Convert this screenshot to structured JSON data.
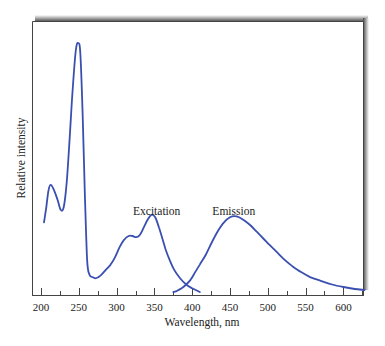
{
  "chart_data": {
    "type": "line",
    "title": "",
    "xlabel": "Wavelength, nm",
    "ylabel": "Relative intensity",
    "xlim": [
      190,
      630
    ],
    "ylim": [
      0,
      1
    ],
    "x_ticks": [
      200,
      250,
      300,
      350,
      400,
      450,
      500,
      550,
      600
    ],
    "x_tick_labels": [
      "200",
      "250",
      "300",
      "350",
      "400",
      "450",
      "500",
      "550",
      "600"
    ],
    "minor_ticks_every": 25,
    "y_ticks": [],
    "grid": false,
    "legend": null,
    "line_color": "#3a4fb0",
    "annotations": [
      {
        "text": "Excitation",
        "x": 353,
        "y": 0.3
      },
      {
        "text": "Emission",
        "x": 455,
        "y": 0.3
      }
    ],
    "series": [
      {
        "name": "Excitation",
        "x": [
          204,
          207,
          210,
          213,
          217,
          222,
          226,
          230,
          234,
          238,
          242,
          246,
          249,
          252,
          255,
          258,
          261,
          264,
          268,
          272,
          276,
          280,
          286,
          292,
          298,
          304,
          310,
          316,
          321,
          326,
          331,
          336,
          341,
          346,
          351,
          356,
          360,
          365,
          370,
          376,
          384,
          392,
          400,
          410
        ],
        "y": [
          0.28,
          0.34,
          0.41,
          0.43,
          0.41,
          0.37,
          0.33,
          0.34,
          0.44,
          0.62,
          0.82,
          0.97,
          1.0,
          0.96,
          0.72,
          0.4,
          0.13,
          0.07,
          0.06,
          0.055,
          0.06,
          0.07,
          0.09,
          0.11,
          0.14,
          0.18,
          0.21,
          0.225,
          0.225,
          0.22,
          0.23,
          0.26,
          0.29,
          0.31,
          0.3,
          0.26,
          0.22,
          0.17,
          0.13,
          0.09,
          0.055,
          0.03,
          0.015,
          0.0
        ]
      },
      {
        "name": "Emission",
        "x": [
          375,
          380,
          386,
          392,
          398,
          404,
          410,
          418,
          426,
          434,
          442,
          450,
          456,
          462,
          470,
          478,
          486,
          494,
          502,
          512,
          522,
          532,
          544,
          556,
          570,
          585,
          600,
          615,
          628
        ],
        "y": [
          0.0,
          0.005,
          0.015,
          0.03,
          0.05,
          0.08,
          0.11,
          0.15,
          0.2,
          0.245,
          0.28,
          0.3,
          0.305,
          0.3,
          0.285,
          0.265,
          0.24,
          0.215,
          0.19,
          0.16,
          0.13,
          0.105,
          0.08,
          0.06,
          0.045,
          0.03,
          0.02,
          0.012,
          0.008
        ]
      }
    ]
  }
}
